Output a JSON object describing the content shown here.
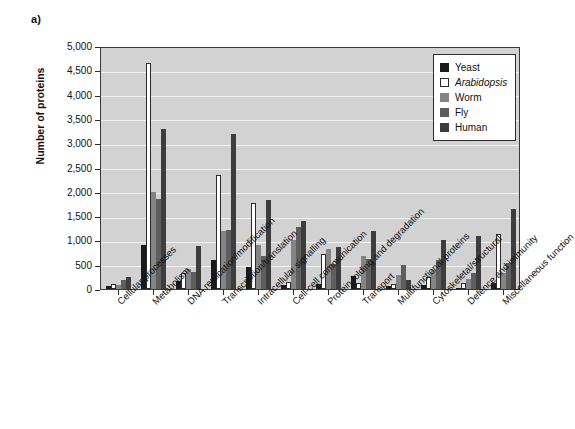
{
  "figure": {
    "panel_label": "a)",
    "y_axis_title": "Number of proteins"
  },
  "legend": {
    "position": "top-right",
    "entries": [
      {
        "label": "Yeast",
        "color": "#1a1a1a",
        "italic": false
      },
      {
        "label": "Arabidopsis",
        "color": "#ffffff",
        "italic": true
      },
      {
        "label": "Worm",
        "color": "#848484",
        "italic": false
      },
      {
        "label": "Fly",
        "color": "#5e5e5e",
        "italic": false
      },
      {
        "label": "Human",
        "color": "#3d3d3d",
        "italic": false
      }
    ]
  },
  "chart_data": {
    "type": "bar",
    "title": "",
    "subtitle": "",
    "xlabel": "",
    "ylabel": "Number of proteins",
    "ylim": [
      0,
      5000
    ],
    "yticks": [
      0,
      500,
      1000,
      1500,
      2000,
      2500,
      3000,
      3500,
      4000,
      4500,
      5000
    ],
    "ytick_labels": [
      "0",
      "500",
      "1,000",
      "1,500",
      "2,000",
      "2,500",
      "3,000",
      "3,500",
      "4,000",
      "4,500",
      "5,000"
    ],
    "grid": true,
    "grid_axis": "y",
    "legend_position": "upper right",
    "categories": [
      "Cellular processes",
      "Metabolism",
      "DNA replication/modification",
      "Transcription/translation",
      "Intracellular signalling",
      "Cell-cell communication",
      "Protein folding and degradation",
      "Transport",
      "Multifunctional proteins",
      "Cytoskeletal/structural",
      "Defence and immunity",
      "Miscellaneous function"
    ],
    "series": [
      {
        "name": "Yeast",
        "color": "#1a1a1a",
        "values": [
          60,
          900,
          160,
          600,
          460,
          80,
          110,
          260,
          60,
          90,
          30,
          120
        ]
      },
      {
        "name": "Arabidopsis",
        "color": "#ffffff",
        "values": [
          100,
          4650,
          320,
          2350,
          1760,
          150,
          720,
          130,
          100,
          240,
          120,
          1130
        ]
      },
      {
        "name": "Worm",
        "color": "#848484",
        "values": [
          90,
          2000,
          420,
          1200,
          900,
          1000,
          820,
          680,
          280,
          390,
          210,
          330
        ]
      },
      {
        "name": "Fly",
        "color": "#5e5e5e",
        "values": [
          180,
          1860,
          340,
          1220,
          680,
          1280,
          520,
          610,
          500,
          590,
          330,
          530
        ]
      },
      {
        "name": "Human",
        "color": "#3d3d3d",
        "values": [
          250,
          3290,
          880,
          3190,
          1830,
          1390,
          870,
          1200,
          190,
          1000,
          1100,
          1640
        ]
      }
    ]
  }
}
